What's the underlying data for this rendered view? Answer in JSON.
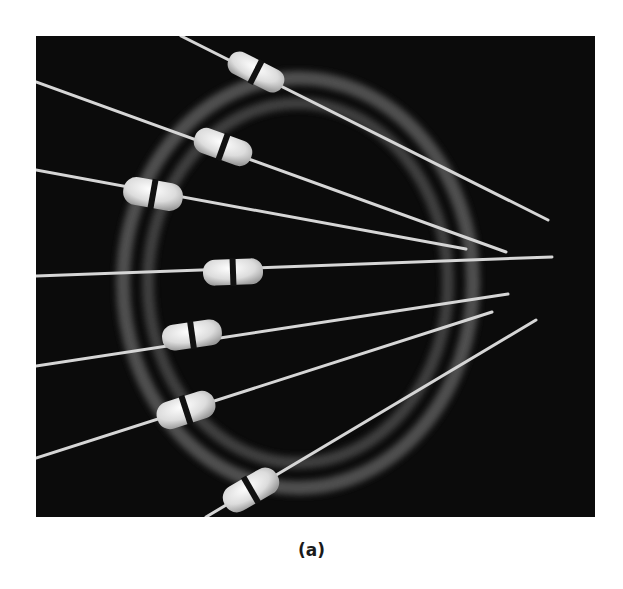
{
  "figure": {
    "caption": "(a)",
    "colors": {
      "background": "#0b0b0b",
      "ring": "#5a5a5a",
      "lead": "#d8d8d8",
      "bead": "#e6e6e6",
      "band": "#111111"
    },
    "component_count": 7
  }
}
